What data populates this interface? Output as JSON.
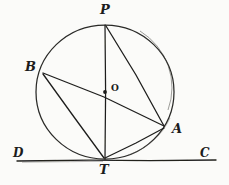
{
  "figure": {
    "kind": "hand-drawn-geometry-sketch",
    "width": 229,
    "height": 185,
    "background_color": "#fbfbf9",
    "ink_color": "#1c1c1c"
  },
  "labels": {
    "p": "P",
    "b": "B",
    "o": "O",
    "a": "A",
    "d": "D",
    "c": "C",
    "t": "T"
  },
  "geometry": {
    "circle": {
      "cx": 105,
      "cy": 92,
      "r": 69
    },
    "center_dot": {
      "cx": 105,
      "cy": 92,
      "r": 1.8
    },
    "points": {
      "P": {
        "x": 105,
        "y": 25
      },
      "B": {
        "x": 42,
        "y": 72
      },
      "A": {
        "x": 165,
        "y": 127
      },
      "T": {
        "x": 105,
        "y": 159
      },
      "O": {
        "x": 105,
        "y": 92
      }
    },
    "tangent_line": {
      "x1": 17,
      "y1": 161,
      "x2": 216,
      "y2": 160
    },
    "segments": [
      {
        "name": "P-T",
        "from": "P",
        "to": "T"
      },
      {
        "name": "P-A",
        "from": "P",
        "to": "A"
      },
      {
        "name": "B-A",
        "from": "B",
        "to": "A"
      },
      {
        "name": "B-T",
        "from": "B",
        "to": "T"
      },
      {
        "name": "T-A",
        "from": "T",
        "to": "A"
      }
    ]
  }
}
